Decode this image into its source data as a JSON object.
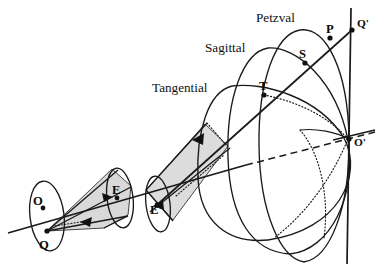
{
  "figure": {
    "background_color": "#ffffff",
    "ink_color": "#111111",
    "shade_color": "#d9d9d9"
  },
  "surface_labels": [
    {
      "id": "petzval",
      "text": "Petzval",
      "x": 256,
      "y": 22
    },
    {
      "id": "sagittal",
      "text": "Sagittal",
      "x": 205,
      "y": 52
    },
    {
      "id": "tangential",
      "text": "Tangential",
      "x": 152,
      "y": 92
    }
  ],
  "points": [
    {
      "id": "O",
      "text": "O",
      "px": 43,
      "py": 208,
      "lx": 33,
      "ly": 205
    },
    {
      "id": "Q",
      "text": "Q",
      "px": 47,
      "py": 231,
      "lx": 39,
      "ly": 249
    },
    {
      "id": "E",
      "text": "E",
      "px": 117,
      "py": 198,
      "lx": 112,
      "ly": 194
    },
    {
      "id": "Ep",
      "text": "E'",
      "px": 157,
      "py": 205,
      "lx": 150,
      "ly": 203
    },
    {
      "id": "T",
      "text": "T",
      "px": 264,
      "py": 95,
      "lx": 259,
      "ly": 90
    },
    {
      "id": "S",
      "text": "S",
      "px": 305,
      "py": 63,
      "lx": 299,
      "ly": 58
    },
    {
      "id": "P",
      "text": "P",
      "px": 330,
      "py": 38,
      "lx": 326,
      "ly": 33
    },
    {
      "id": "Qp",
      "text": "Q'",
      "px": 352,
      "py": 30,
      "lx": 357,
      "ly": 27
    },
    {
      "id": "Op",
      "text": "O'",
      "px": 349,
      "py": 139,
      "lx": 354,
      "ly": 144
    }
  ],
  "elements": {
    "optical_axis": "principal axis from object plane O through lenses E and E' to image point O'",
    "image_plane": "vertical paraxial image plane line through O' and Q'",
    "ray_cone_1": "shaded cone from object point Q to lens aperture E",
    "ray_cone_2": "shaded cone diverging from lens E' toward the image surfaces",
    "surfaces": [
      "tangential",
      "sagittal",
      "petzval"
    ],
    "chief_ray": "ray from E' through T, S, P to Q'"
  }
}
